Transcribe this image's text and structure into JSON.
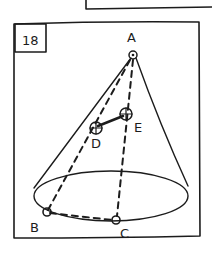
{
  "figure": {
    "number": "18",
    "points": {
      "apex": "A",
      "base_left": "B",
      "base_front": "C",
      "mid_left": "D",
      "mid_right": "E"
    }
  },
  "colors": {
    "ink": "#1c1c1c",
    "paper": "#ffffff"
  }
}
